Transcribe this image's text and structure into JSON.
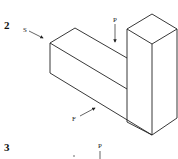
{
  "figures": [
    {
      "number": "2",
      "description": "Isometric L-shaped block with tall rectangular tower at right end",
      "labels": {
        "side_view": "S",
        "plan_view": "P",
        "front_view": "F"
      }
    },
    {
      "number": "3",
      "labels": {
        "plan_view": "P"
      }
    }
  ],
  "colors": {
    "line": "#222222",
    "background": "#ffffff"
  }
}
